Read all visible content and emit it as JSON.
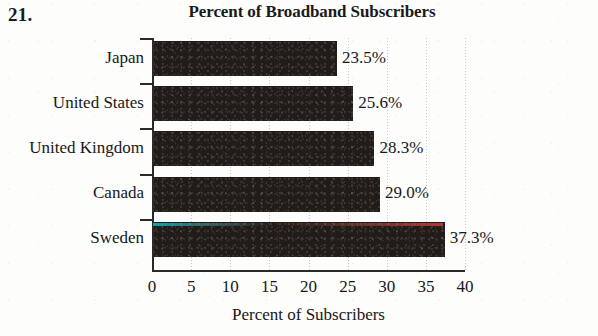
{
  "exercise": {
    "number": "21."
  },
  "chart_data": {
    "type": "bar",
    "orientation": "horizontal",
    "title": "Percent of Broadband Subscribers",
    "xlabel": "Percent of Subscribers",
    "ylabel": "",
    "categories": [
      "Japan",
      "United States",
      "United Kingdom",
      "Canada",
      "Sweden"
    ],
    "values": [
      23.5,
      25.6,
      28.3,
      29.0,
      37.3
    ],
    "value_labels": [
      "23.5%",
      "25.6%",
      "28.3%",
      "29.0%",
      "37.3%"
    ],
    "xlim": [
      0,
      40
    ],
    "xticks": [
      0,
      5,
      10,
      15,
      20,
      25,
      30,
      35,
      40
    ],
    "xtick_labels": [
      "0",
      "5",
      "10",
      "15",
      "20",
      "25",
      "30",
      "35",
      "40"
    ],
    "grid": true,
    "grid_axis": "x",
    "legend": null,
    "bar_color": "#221c18",
    "axis_color": "#2a2a28",
    "grid_color": "#c9c9c4",
    "background_color": "#fdfdfc"
  }
}
